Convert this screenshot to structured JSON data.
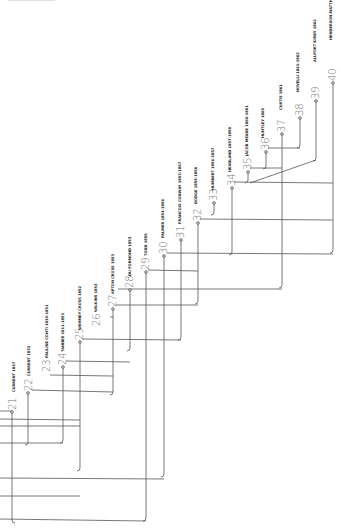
{
  "diagram": {
    "type": "rotated-genealogy-tree",
    "orientation": "rotated 90deg counter-clockwise",
    "nodes": [
      {
        "id": "21",
        "label": "CURRENT 1847",
        "x": 12,
        "y": 412
      },
      {
        "id": "22",
        "label": "CURRENT 1832",
        "x": 28,
        "y": 393
      },
      {
        "id": "23",
        "label": "",
        "x": 50,
        "y": 375
      },
      {
        "id": "24",
        "label": "PAULINE CONTI 1830-1851",
        "x": 63,
        "y": 367
      },
      {
        "id": "25",
        "label": "TANNER 1811-1853",
        "x": 80,
        "y": 342
      },
      {
        "id": "26",
        "label": "",
        "x": 107,
        "y": 320
      },
      {
        "id": "27",
        "label": "WEHMEY CROSS 1852",
        "x": 113,
        "y": 309
      },
      {
        "id": "28",
        "label": "WILKINS 1853",
        "x": 130,
        "y": 290
      },
      {
        "id": "29",
        "label": "APTON CROSS 1853",
        "x": 146,
        "y": 272
      },
      {
        "id": "30",
        "label": "DU FORMOND 1853",
        "x": 164,
        "y": 256
      },
      {
        "id": "31",
        "label": "TODD 1855",
        "x": 181,
        "y": 240
      },
      {
        "id": "32",
        "label": "PALMER 1854-1856",
        "x": 198,
        "y": 223
      },
      {
        "id": "33",
        "label": "FRANCOIS CONWAY 1853-1857",
        "x": 214,
        "y": 203
      },
      {
        "id": "34",
        "label": "DODGE 1855-1856",
        "x": 232,
        "y": 188
      },
      {
        "id": "35",
        "label": "HUMBERT 1856-1857",
        "x": 248,
        "y": 172
      },
      {
        "id": "36",
        "label": "HEADLAND 1857-1858",
        "x": 266,
        "y": 152
      },
      {
        "id": "37",
        "label": "JACOB MEADE 1860-1861",
        "x": 282,
        "y": 134
      },
      {
        "id": "38",
        "label": "HUNTLEY 1860",
        "x": 300,
        "y": 118
      },
      {
        "id": "39",
        "label": "CURTIS 1861",
        "x": 316,
        "y": 101
      },
      {
        "id": "40",
        "label": "NOVELLI 1861-1862",
        "x": 333,
        "y": 83
      }
    ],
    "extra_labels": [
      {
        "text": "ALLPORT KIRBY 1862",
        "x": 316,
        "y": 40
      },
      {
        "text": "HENDERSON MATTHEWS 1862",
        "x": 333,
        "y": 18
      }
    ]
  }
}
